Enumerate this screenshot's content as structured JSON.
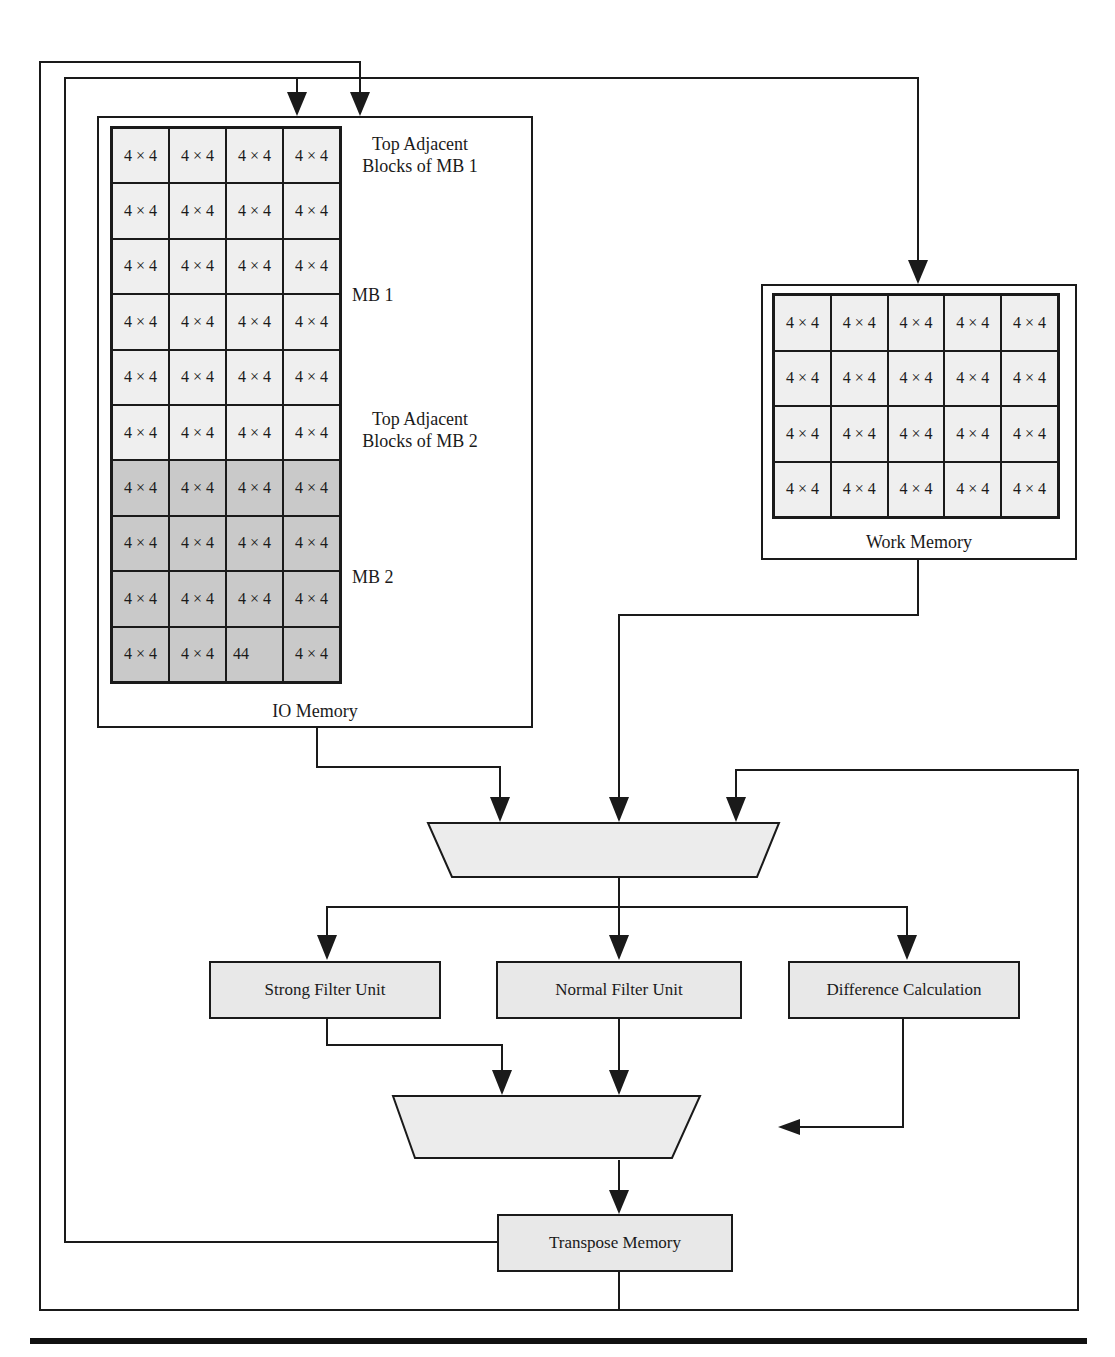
{
  "io_memory": {
    "title": "IO Memory",
    "rows": [
      {
        "cells": [
          "4 × 4",
          "4 × 4",
          "4 × 4",
          "4 × 4"
        ],
        "shade": "light"
      },
      {
        "cells": [
          "4 × 4",
          "4 × 4",
          "4 × 4",
          "4 × 4"
        ],
        "shade": "light"
      },
      {
        "cells": [
          "4 × 4",
          "4 × 4",
          "4 × 4",
          "4 × 4"
        ],
        "shade": "light"
      },
      {
        "cells": [
          "4 × 4",
          "4 × 4",
          "4 × 4",
          "4 × 4"
        ],
        "shade": "light"
      },
      {
        "cells": [
          "4 × 4",
          "4 × 4",
          "4 × 4",
          "4 × 4"
        ],
        "shade": "light"
      },
      {
        "cells": [
          "4 × 4",
          "4 × 4",
          "4 × 4",
          "4 × 4"
        ],
        "shade": "light"
      },
      {
        "cells": [
          "4 × 4",
          "4 × 4",
          "4 × 4",
          "4 × 4"
        ],
        "shade": "dark"
      },
      {
        "cells": [
          "4 × 4",
          "4 × 4",
          "4 × 4",
          "4 × 4"
        ],
        "shade": "dark"
      },
      {
        "cells": [
          "4 × 4",
          "4 × 4",
          "4 × 4",
          "4 × 4"
        ],
        "shade": "dark"
      },
      {
        "cells": [
          "4 × 4",
          "4 × 4",
          "44",
          "4 × 4"
        ],
        "shade": "dark"
      }
    ],
    "annotations": {
      "top_adj_mb1_line1": "Top Adjacent",
      "top_adj_mb1_line2": "Blocks of MB 1",
      "mb1": "MB 1",
      "top_adj_mb2_line1": "Top Adjacent",
      "top_adj_mb2_line2": "Blocks of MB 2",
      "mb2": "MB 2"
    }
  },
  "work_memory": {
    "title": "Work Memory",
    "rows": [
      [
        "4 × 4",
        "4 × 4",
        "4 × 4",
        "4 × 4",
        "4 × 4"
      ],
      [
        "4 × 4",
        "4 × 4",
        "4 × 4",
        "4 × 4",
        "4 × 4"
      ],
      [
        "4 × 4",
        "4 × 4",
        "4 × 4",
        "4 × 4",
        "4 × 4"
      ],
      [
        "4 × 4",
        "4 × 4",
        "4 × 4",
        "4 × 4",
        "4 × 4"
      ]
    ]
  },
  "units": {
    "strong_filter": "Strong Filter Unit",
    "normal_filter": "Normal Filter Unit",
    "difference_calc": "Difference Calculation",
    "transpose_memory": "Transpose Memory"
  },
  "colors": {
    "line": "#1a1a1a",
    "light_cell": "#efefef",
    "dark_cell": "#c9c9c9",
    "unit_fill": "#e8e8e8"
  }
}
